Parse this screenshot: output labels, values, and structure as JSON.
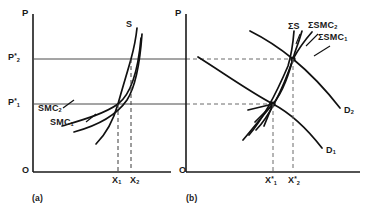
{
  "figure": {
    "type": "economics-diagram"
  },
  "panel_a": {
    "caption": "(a)",
    "y_axis_label": "P",
    "origin_label": "O",
    "price_ticks": [
      {
        "id": "p1",
        "text": "P",
        "sub": "1",
        "sup": "*"
      },
      {
        "id": "p2",
        "text": "P",
        "sub": "2",
        "sup": "*"
      }
    ],
    "quantity_ticks": [
      {
        "id": "x1",
        "text": "X",
        "sub": "1"
      },
      {
        "id": "x2",
        "text": "X",
        "sub": "2"
      }
    ],
    "curves": [
      {
        "id": "s",
        "text": "S",
        "sub": ""
      },
      {
        "id": "smc2",
        "text": "SMC",
        "sub": "2"
      },
      {
        "id": "smc1",
        "text": "SMC",
        "sub": "1"
      }
    ]
  },
  "panel_b": {
    "caption": "(b)",
    "y_axis_label": "P",
    "origin_label": "O",
    "quantity_ticks": [
      {
        "id": "x1s",
        "text": "X",
        "sub": "1",
        "sup": "*"
      },
      {
        "id": "x2s",
        "text": "X",
        "sub": "2",
        "sup": "*"
      }
    ],
    "curves": [
      {
        "id": "sumS",
        "text": "ΣS",
        "sub": ""
      },
      {
        "id": "sumSMC2",
        "text": "ΣSMC",
        "sub": "2"
      },
      {
        "id": "sumSMC1",
        "text": "ΣSMC",
        "sub": "1"
      },
      {
        "id": "d2",
        "text": "D",
        "sub": "2"
      },
      {
        "id": "d1",
        "text": "D",
        "sub": "1"
      }
    ]
  },
  "colors": {
    "ink": "#1a1a1a",
    "curve": "#111111",
    "guide_solid": "#4a4a4a",
    "guide_dashed": "#6b6b6b",
    "background": "#ffffff"
  }
}
